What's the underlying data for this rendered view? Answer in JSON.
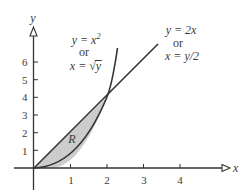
{
  "diagram": {
    "axes": {
      "x_label": "x",
      "y_label": "y",
      "x_ticks": [
        "1",
        "2",
        "3",
        "4"
      ],
      "y_ticks": [
        "1",
        "2",
        "3",
        "4",
        "5",
        "6"
      ]
    },
    "curve_parabola": {
      "line1": "y = x",
      "line1_exp": "2",
      "line2": "or",
      "line3_prefix": "x = ",
      "line3_radical": "√",
      "line3_radicand": "y"
    },
    "curve_line": {
      "line1": "y = 2x",
      "line2": "or",
      "line3": "x = y/2"
    },
    "region_label": "R",
    "colors": {
      "stroke": "#333333",
      "region_fill": "#cccccc",
      "text": "#3a3a3a"
    }
  }
}
